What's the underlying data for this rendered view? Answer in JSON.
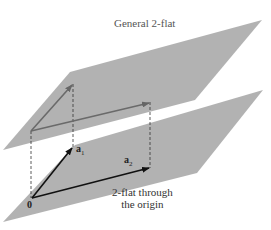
{
  "title": "General 2-flat",
  "origin_flat_label_line1": "2-flat through",
  "origin_flat_label_line2": "the origin",
  "origin_label": "0",
  "vectors": [
    {
      "name": "a",
      "subscript": "1"
    },
    {
      "name": "a",
      "subscript": "2"
    }
  ],
  "colors": {
    "plane": "#a9a9a9",
    "upper_vectors": "#6a6a6a",
    "lower_vectors": "#1a1a1a",
    "dashed": "#333333"
  }
}
